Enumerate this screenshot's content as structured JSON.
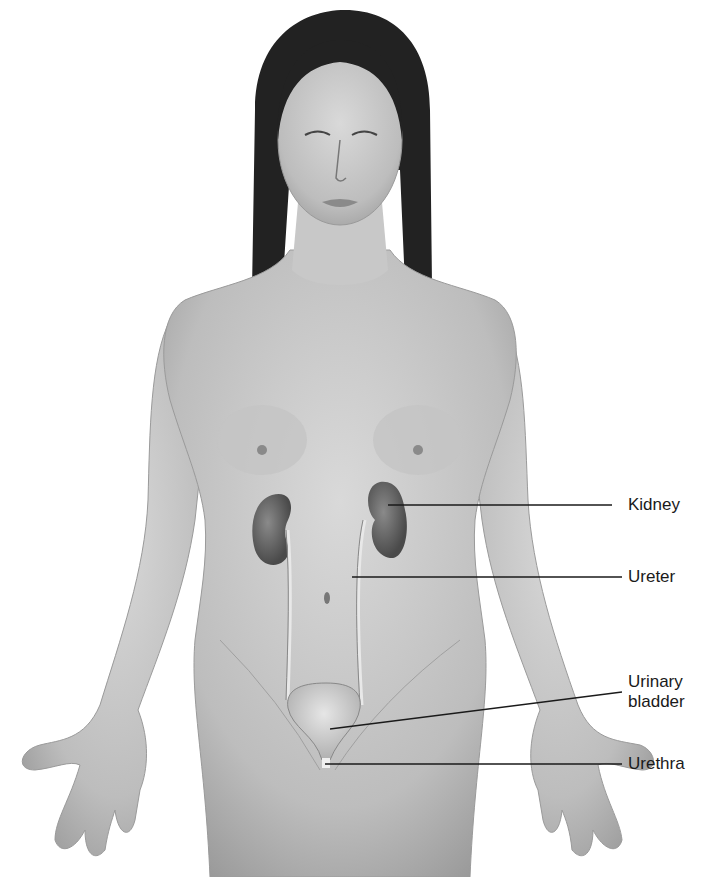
{
  "figure": {
    "labels": [
      {
        "id": "kidney",
        "text": "Kidney"
      },
      {
        "id": "ureter",
        "text": "Ureter"
      },
      {
        "id": "urinary_bladder",
        "text": "Urinary\nbladder",
        "line1": "Urinary",
        "line2": "bladder"
      },
      {
        "id": "urethra",
        "text": "Urethra"
      }
    ]
  },
  "colors": {
    "skin_light": "#d8d8d8",
    "skin_mid": "#b5b5b5",
    "skin_dark": "#8a8a8a",
    "hair": "#1e1e1e",
    "organ": "#6a6a6a",
    "leader_line": "#1a1a1a",
    "label_text": "#1a1a1a"
  }
}
